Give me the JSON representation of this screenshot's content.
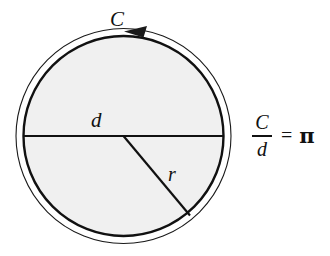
{
  "figure": {
    "background_color": "#ffffff",
    "stroke_color": "#111111",
    "fill_color": "#f0f0f0"
  },
  "labels": {
    "circumference": "C",
    "diameter": "d",
    "radius": "r"
  },
  "formula": {
    "numerator": "C",
    "denominator": "d",
    "equals": "=",
    "result": "π"
  },
  "geometry": {
    "center_x": 123.5,
    "center_y": 136,
    "inner_radius": 100,
    "outer_radius": 108,
    "diameter_line": {
      "x1": 24,
      "y1": 136,
      "x2": 223,
      "y2": 136
    },
    "radius_line": {
      "x1": 123.5,
      "y1": 136,
      "x2": 190,
      "y2": 215
    },
    "arrow_direction": "counterclockwise",
    "arrow_tip": {
      "x": 124,
      "y": 31
    }
  }
}
